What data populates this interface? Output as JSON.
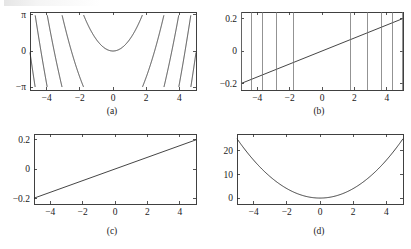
{
  "figure": {
    "caption_prefix": "",
    "background_color": "#ffffff",
    "curve_color": "#232323",
    "axis_color": "#2b2b2b",
    "spike_color": "#6f6f6f",
    "width": 411,
    "height": 249
  },
  "panels": [
    {
      "id": "a",
      "caption": "(a)",
      "x_ticks": [
        -4,
        -2,
        0,
        2,
        4
      ],
      "x_tick_labels": [
        "−4",
        "−2",
        "0",
        "2",
        "4"
      ],
      "y_ticks": [
        -3.14159265,
        0,
        3.14159265
      ],
      "y_tick_labels": [
        "−π",
        "0",
        "π"
      ],
      "xlim": [
        -5,
        5
      ],
      "ylim": [
        -3.4,
        3.4
      ]
    },
    {
      "id": "b",
      "caption": "(b)",
      "x_ticks": [
        -4,
        -2,
        0,
        2,
        4
      ],
      "x_tick_labels": [
        "−4",
        "−2",
        "0",
        "2",
        "4"
      ],
      "y_ticks": [
        -0.2,
        0,
        0.2
      ],
      "y_tick_labels": [
        "−0.2",
        "0",
        "0.2"
      ],
      "xlim": [
        -5,
        5
      ],
      "ylim": [
        -0.24,
        0.24
      ]
    },
    {
      "id": "c",
      "caption": "(c)",
      "x_ticks": [
        -4,
        -2,
        0,
        2,
        4
      ],
      "x_tick_labels": [
        "−4",
        "−2",
        "0",
        "2",
        "4"
      ],
      "y_ticks": [
        -0.2,
        0,
        0.2
      ],
      "y_tick_labels": [
        "−0.2",
        "0",
        "0.2"
      ],
      "xlim": [
        -5,
        5
      ],
      "ylim": [
        -0.24,
        0.24
      ]
    },
    {
      "id": "d",
      "caption": "(d)",
      "x_ticks": [
        -4,
        -2,
        0,
        2,
        4
      ],
      "x_tick_labels": [
        "−4",
        "−2",
        "0",
        "2",
        "4"
      ],
      "y_ticks": [
        0,
        10,
        20
      ],
      "y_tick_labels": [
        "0",
        "10",
        "20"
      ],
      "xlim": [
        -5,
        5
      ],
      "ylim": [
        -2.5,
        27
      ]
    }
  ],
  "chart_data": [
    {
      "panel": "a",
      "type": "line",
      "title": "(a)",
      "xlabel": "",
      "ylabel": "",
      "xlim": [
        -5,
        5
      ],
      "ylim": [
        -3.4,
        3.4
      ],
      "grid": false,
      "legend": "none",
      "xticks": [
        -4,
        -2,
        0,
        2,
        4
      ],
      "yticks": [
        -3.14159265,
        0,
        3.14159265
      ],
      "ytick_labels": [
        "-pi",
        "0",
        "pi"
      ],
      "series": [
        {
          "name": "wrapped phase",
          "formula": "wrap(x^2) mapped to (-pi, pi]",
          "description": "Sawtooth wrapped parabola: equals x^2 reduced modulo 2*pi into the interval (-pi, pi], producing branch jumps where x^2 crosses odd multiples of pi",
          "sample_interval": 0.005,
          "branch_discontinuities": [
            -4.94,
            -4.34,
            -3.65,
            -2.81,
            -1.77,
            1.77,
            2.81,
            3.65,
            4.34,
            4.94
          ],
          "minimum_value_at_x0": 0.0
        }
      ]
    },
    {
      "panel": "b",
      "type": "line",
      "title": "(b)",
      "xlabel": "",
      "ylabel": "",
      "xlim": [
        -5,
        5
      ],
      "ylim": [
        -0.24,
        0.24
      ],
      "grid": false,
      "legend": "none",
      "xticks": [
        -4,
        -2,
        0,
        2,
        4
      ],
      "yticks": [
        -0.2,
        0,
        0.2
      ],
      "series": [
        {
          "name": "wrapped derivative estimate",
          "formula": "y = 0.04*x",
          "description": "Straight ramp from (-5,-0.2) to (5,0.2) with full-height vertical spikes at each wrap discontinuity of panel (a)",
          "endpoints": [
            [
              -5,
              -0.2
            ],
            [
              5,
              0.2
            ]
          ],
          "slope": 0.04,
          "intercept": 0.0
        },
        {
          "name": "spikes",
          "type": "vertical-lines",
          "x_positions": [
            -4.94,
            -4.34,
            -3.65,
            -2.81,
            -1.77,
            1.77,
            2.81,
            3.65,
            4.34,
            4.94
          ],
          "description": "vertical line segments spanning the full y range at the discontinuity abscissae"
        }
      ]
    },
    {
      "panel": "c",
      "type": "line",
      "title": "(c)",
      "xlabel": "",
      "ylabel": "",
      "xlim": [
        -5,
        5
      ],
      "ylim": [
        -0.24,
        0.24
      ],
      "grid": false,
      "legend": "none",
      "xticks": [
        -4,
        -2,
        0,
        2,
        4
      ],
      "yticks": [
        -0.2,
        0,
        0.2
      ],
      "series": [
        {
          "name": "cleaned derivative",
          "formula": "y = 0.04*x",
          "description": "Smooth straight line with spikes removed",
          "endpoints": [
            [
              -5,
              -0.2
            ],
            [
              5,
              0.2
            ]
          ],
          "slope": 0.04,
          "intercept": 0.0
        }
      ]
    },
    {
      "panel": "d",
      "type": "line",
      "title": "(d)",
      "xlabel": "",
      "ylabel": "",
      "xlim": [
        -5,
        5
      ],
      "ylim": [
        -2.5,
        27
      ],
      "grid": false,
      "legend": "none",
      "xticks": [
        -4,
        -2,
        0,
        2,
        4
      ],
      "yticks": [
        0,
        10,
        20
      ],
      "series": [
        {
          "name": "unwrapped phase",
          "formula": "y = x^2",
          "description": "Parabola recovered by integrating panel (c); minimum 0 at x=0, reaching 25 at x = +/-5",
          "sample_interval": 0.05,
          "vertex": [
            0,
            0
          ],
          "endpoints": [
            [
              -5,
              25
            ],
            [
              5,
              25
            ]
          ]
        }
      ]
    }
  ]
}
